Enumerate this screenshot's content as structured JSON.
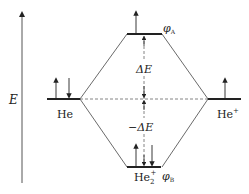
{
  "diagram": {
    "axis_label": "E",
    "left_atom": "He",
    "right_atom": "He",
    "right_atom_sup": "+",
    "molecule": "He",
    "molecule_sub": "2",
    "molecule_sup": "+",
    "antibonding_orbital": "φ",
    "antibonding_sub": "A",
    "bonding_orbital": "φ",
    "bonding_sub": "B",
    "delta_up": "ΔE",
    "delta_down": "−ΔE",
    "colors": {
      "line": "#333333",
      "level": "#222222",
      "dash": "#555555"
    }
  }
}
